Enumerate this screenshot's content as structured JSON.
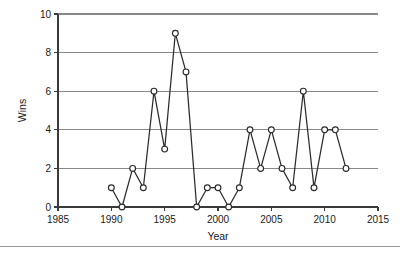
{
  "chart_data": {
    "type": "line",
    "title": "",
    "xlabel": "Year",
    "ylabel": "Wins",
    "xlim": [
      1985,
      2015
    ],
    "ylim": [
      0,
      10
    ],
    "xticks": [
      1985,
      1990,
      1995,
      2000,
      2005,
      2010,
      2015
    ],
    "yticks": [
      0,
      2,
      4,
      6,
      8,
      10
    ],
    "grid": "horizontal",
    "legend": "none",
    "marker": "open-circle",
    "line_color": "#2b2b2b",
    "marker_fill": "#ffffff",
    "grid_color": "#888888",
    "x": [
      1990,
      1991,
      1992,
      1993,
      1994,
      1995,
      1996,
      1997,
      1998,
      1999,
      2000,
      2001,
      2002,
      2003,
      2004,
      2005,
      2006,
      2007,
      2008,
      2009,
      2010,
      2011,
      2012
    ],
    "values": [
      1,
      0,
      2,
      1,
      6,
      3,
      9,
      7,
      0,
      1,
      1,
      0,
      1,
      4,
      2,
      4,
      2,
      1,
      6,
      1,
      4,
      4,
      2
    ],
    "series": [
      {
        "name": "Wins",
        "values": [
          1,
          0,
          2,
          1,
          6,
          3,
          9,
          7,
          0,
          1,
          1,
          0,
          1,
          4,
          2,
          4,
          2,
          1,
          6,
          1,
          4,
          4,
          2
        ]
      }
    ]
  }
}
